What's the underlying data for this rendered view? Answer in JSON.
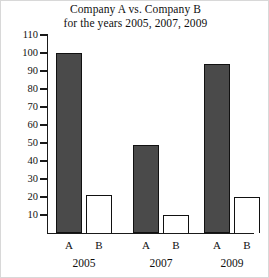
{
  "chart_data": {
    "type": "bar",
    "title": "Company A vs. Company B for the years 2005, 2007, 2009",
    "title_lines": [
      "Company A vs. Company B",
      "for the years 2005, 2007, 2009"
    ],
    "categories": [
      "2005",
      "2007",
      "2009"
    ],
    "subcategories": [
      "A",
      "B"
    ],
    "series": [
      {
        "name": "A",
        "values": [
          100,
          49,
          94
        ],
        "fill": "#4a4a4a",
        "style": "solid"
      },
      {
        "name": "B",
        "values": [
          21,
          10,
          20
        ],
        "fill": "#ffffff",
        "style": "hollow"
      }
    ],
    "xlabel": "",
    "ylabel": "",
    "ylim": [
      0,
      110
    ],
    "ytick_labels": [
      "110",
      "100",
      "90",
      "80",
      "70",
      "60",
      "50",
      "40",
      "30",
      "20",
      "10"
    ],
    "ytick_values": [
      110,
      100,
      90,
      80,
      70,
      60,
      50,
      40,
      30,
      20,
      10
    ],
    "grid": false,
    "legend": "none",
    "bars": [
      {
        "group": "2005",
        "series": "A",
        "value": 100,
        "style": "solid"
      },
      {
        "group": "2005",
        "series": "B",
        "value": 21,
        "style": "hollow"
      },
      {
        "group": "2007",
        "series": "A",
        "value": 49,
        "style": "solid"
      },
      {
        "group": "2007",
        "series": "B",
        "value": 10,
        "style": "hollow"
      },
      {
        "group": "2009",
        "series": "A",
        "value": 94,
        "style": "solid"
      },
      {
        "group": "2009",
        "series": "B",
        "value": 20,
        "style": "hollow"
      }
    ],
    "series_tick_labels": [
      "A",
      "B",
      "A",
      "B",
      "A",
      "B"
    ]
  },
  "colors": {
    "bar_fill": "#4a4a4a",
    "bar_outline": "#111111",
    "axis": "#1a1a1a",
    "text": "#101010",
    "background": "#ffffff"
  }
}
